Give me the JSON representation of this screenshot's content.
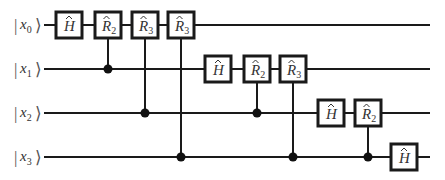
{
  "diagram": {
    "colors": {
      "line": "#1a1a1a",
      "gate_fill": "#ffffff",
      "text": "#333333"
    },
    "qubits": [
      {
        "label": "x",
        "sub": "0",
        "y": 25
      },
      {
        "label": "x",
        "sub": "1",
        "y": 69
      },
      {
        "label": "x",
        "sub": "2",
        "y": 113
      },
      {
        "label": "x",
        "sub": "3",
        "y": 157
      }
    ],
    "wire_start_x": 44,
    "wire_end_x": 430,
    "gates": [
      {
        "qubit": 0,
        "x": 69,
        "name": "H",
        "sub": "",
        "control": null
      },
      {
        "qubit": 0,
        "x": 108,
        "name": "R",
        "sub": "2",
        "control": 1
      },
      {
        "qubit": 0,
        "x": 145,
        "name": "R",
        "sub": "3",
        "control": 2
      },
      {
        "qubit": 0,
        "x": 181,
        "name": "R",
        "sub": "3",
        "control": 3
      },
      {
        "qubit": 1,
        "x": 218,
        "name": "H",
        "sub": "",
        "control": null
      },
      {
        "qubit": 1,
        "x": 257,
        "name": "R",
        "sub": "2",
        "control": 2
      },
      {
        "qubit": 1,
        "x": 293,
        "name": "R",
        "sub": "3",
        "control": 3
      },
      {
        "qubit": 2,
        "x": 331,
        "name": "H",
        "sub": "",
        "control": null
      },
      {
        "qubit": 2,
        "x": 368,
        "name": "R",
        "sub": "2",
        "control": 3
      },
      {
        "qubit": 3,
        "x": 404,
        "name": "H",
        "sub": "",
        "control": null
      }
    ]
  }
}
